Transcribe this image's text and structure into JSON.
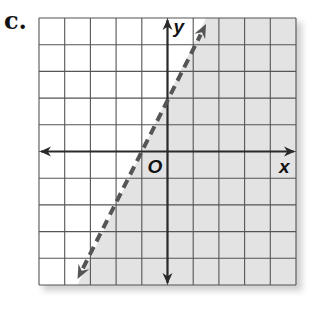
{
  "problem": {
    "label": "c."
  },
  "chart_data": {
    "type": "line",
    "subtype": "linear-inequality-graph",
    "title": "",
    "xlabel": "x",
    "ylabel": "y",
    "origin_label": "O",
    "xlim": [
      -5,
      5
    ],
    "ylim": [
      -5,
      5
    ],
    "grid": true,
    "grid_step": 1,
    "tick_labels": false,
    "boundary_line": {
      "equation": "y = 2x + 2",
      "slope": 2,
      "intercept": 2,
      "style": "dashed",
      "arrows": "both",
      "points": [
        [
          -3.5,
          -5
        ],
        [
          -1,
          0
        ],
        [
          0,
          2
        ],
        [
          1.5,
          5
        ]
      ]
    },
    "shaded_region": {
      "inequality": "y < 2x + 2",
      "side": "right/below boundary",
      "color": "#e3e3e3"
    }
  },
  "colors": {
    "grid": "#555555",
    "axis": "#2a2a2a",
    "boundary": "#555555",
    "shade": "#e3e3e3",
    "shadow": "#d0d0d0"
  }
}
